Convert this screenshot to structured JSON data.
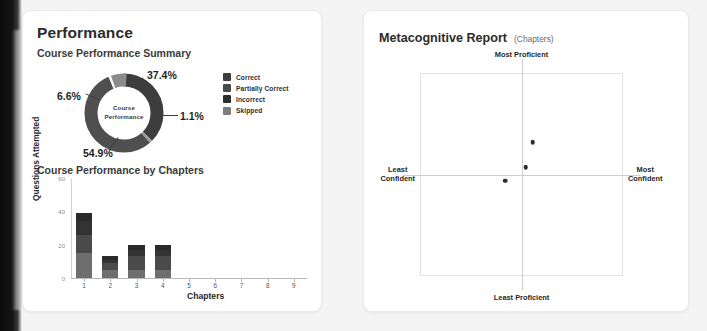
{
  "performance_card": {
    "title": "Performance",
    "summary_title": "Course Performance Summary",
    "chapters_title": "Course Performance by Chapters",
    "donut_center_line1": "Course",
    "donut_center_line2": "Performance",
    "percent_labels": {
      "correct": "37.4%",
      "partially_correct": "6.6%",
      "incorrect": "1.1%",
      "skipped": "54.9%"
    },
    "legend": [
      {
        "label": "Correct",
        "color": "#3d3d3d"
      },
      {
        "label": "Partially Correct",
        "color": "#4a4a4a"
      },
      {
        "label": "Incorrect",
        "color": "#2e2e2e"
      },
      {
        "label": "Skipped",
        "color": "#7d7d7d"
      }
    ]
  },
  "metacognitive_card": {
    "title": "Metacognitive Report",
    "subtitle": "(Chapters)",
    "axis_labels": {
      "top": "Most Proficient",
      "bottom": "Least Proficient",
      "left": "Least\nConfident",
      "right": "Most\nConfident"
    }
  },
  "chart_data": [
    {
      "type": "pie",
      "title": "Course Performance Summary",
      "center_label": "Course Performance",
      "labels": [
        "Correct",
        "Partially Correct",
        "Incorrect",
        "Skipped"
      ],
      "values": [
        37.4,
        6.6,
        1.1,
        54.9
      ],
      "value_labels": [
        "37.4%",
        "6.6%",
        "1.1%",
        "54.9%"
      ],
      "colors": [
        "#3d3d3d",
        "#4a4a4a",
        "#2e2e2e",
        "#7d7d7d"
      ],
      "unit": "percent",
      "donut": true,
      "legend_position": "right"
    },
    {
      "type": "bar",
      "title": "Course Performance by Chapters",
      "xlabel": "Chapters",
      "ylabel": "Questions Attempted",
      "categories": [
        "1",
        "2",
        "3",
        "4",
        "5",
        "6",
        "7",
        "8",
        "9"
      ],
      "values": [
        39,
        13,
        20,
        20,
        0,
        0,
        0,
        0,
        0
      ],
      "stacked": true,
      "series": [
        {
          "name": "Correct",
          "values": [
            15,
            5,
            5,
            5,
            0,
            0,
            0,
            0,
            0
          ]
        },
        {
          "name": "Partially Correct",
          "values": [
            11,
            4,
            8,
            8,
            0,
            0,
            0,
            0,
            0
          ]
        },
        {
          "name": "Incorrect",
          "values": [
            8,
            2,
            4,
            4,
            0,
            0,
            0,
            0,
            0
          ]
        },
        {
          "name": "Skipped",
          "values": [
            5,
            2,
            3,
            3,
            0,
            0,
            0,
            0,
            0
          ]
        }
      ],
      "ylim": [
        0,
        60
      ],
      "yticks": [
        0,
        20,
        40,
        60
      ],
      "grid": false
    },
    {
      "type": "scatter",
      "title": "Metacognitive Report (Chapters)",
      "xlabel_low": "Least Confident",
      "xlabel_high": "Most Confident",
      "ylabel_low": "Least Proficient",
      "ylabel_high": "Most Proficient",
      "xlim": [
        -1,
        1
      ],
      "ylim": [
        -1,
        1
      ],
      "quadrant_lines": true,
      "points": [
        {
          "x": 0.11,
          "y": 0.32
        },
        {
          "x": 0.04,
          "y": 0.07
        },
        {
          "x": -0.16,
          "y": -0.06
        }
      ]
    }
  ]
}
